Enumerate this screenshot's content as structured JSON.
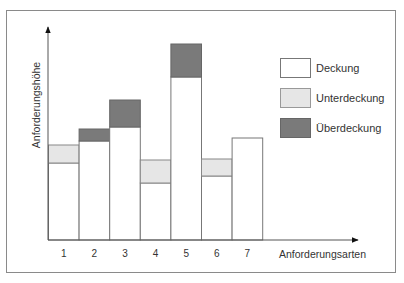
{
  "chart_data": {
    "type": "bar",
    "stacked": true,
    "title": "",
    "xlabel": "Anforderungsarten",
    "ylabel": "Anforderungshöhe",
    "categories": [
      "1",
      "2",
      "3",
      "4",
      "5",
      "6",
      "7"
    ],
    "series": [
      {
        "name": "Deckung",
        "color": "#ffffff",
        "values": [
          77,
          99,
          113,
          57,
          163,
          64,
          102
        ]
      },
      {
        "name": "Unterdeckung",
        "color": "#e6e6e6",
        "values": [
          18,
          0,
          0,
          23,
          0,
          17,
          0
        ]
      },
      {
        "name": "Überdeckung",
        "color": "#7a7a7a",
        "values": [
          0,
          12,
          27,
          0,
          33,
          0,
          0
        ]
      }
    ],
    "ylim": [
      0,
      213
    ],
    "grid": false,
    "y_ticks": false,
    "legend_position": "upper right, inside plot",
    "units": "relative (unlabeled axis, values in pixel units)"
  },
  "axes": {
    "x_label": "Anforderungsarten",
    "y_label": "Anforderungshöhe"
  },
  "legend": [
    {
      "label": "Deckung",
      "color": "#ffffff"
    },
    {
      "label": "Unterdeckung",
      "color": "#e6e6e6"
    },
    {
      "label": "Überdeckung",
      "color": "#7a7a7a"
    }
  ]
}
